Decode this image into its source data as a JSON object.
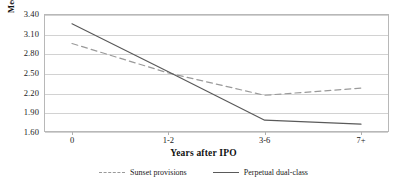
{
  "chart_data": {
    "type": "line",
    "title": "",
    "xlabel": "Years after IPO",
    "ylabel": "Median relative valuation (Q)",
    "categories": [
      "0",
      "1-2",
      "3-6",
      "7+"
    ],
    "ylim": [
      1.6,
      3.4
    ],
    "ytick_labels": [
      "3.40",
      "3.10",
      "2.80",
      "2.50",
      "2.20",
      "1.90",
      "1.60"
    ],
    "ytick_values": [
      3.4,
      3.1,
      2.8,
      2.5,
      2.2,
      1.9,
      1.6
    ],
    "grid": true,
    "legend_position": "bottom",
    "series": [
      {
        "name": "Sunset provisions",
        "style": "dashed",
        "color": "#9a9a9a",
        "values": [
          2.95,
          2.5,
          2.16,
          2.27
        ]
      },
      {
        "name": "Perpetual dual-class",
        "style": "solid",
        "color": "#5a5a5a",
        "values": [
          3.25,
          2.52,
          1.78,
          1.72
        ]
      }
    ]
  },
  "axis": {
    "y_title": "Median relative valuation (Q)",
    "x_title": "Years after IPO"
  },
  "legend": {
    "items": [
      {
        "label": "Sunset provisions"
      },
      {
        "label": "Perpetual dual-class"
      }
    ]
  }
}
